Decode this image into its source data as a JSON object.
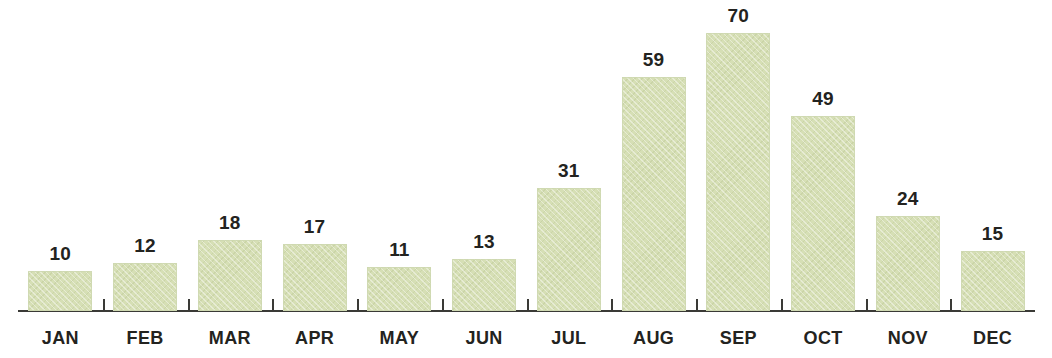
{
  "chart_data": {
    "type": "bar",
    "title": "",
    "subtitle": "",
    "xlabel": "",
    "ylabel": "",
    "categories": [
      "JAN",
      "FEB",
      "MAR",
      "APR",
      "MAY",
      "JUN",
      "JUL",
      "AUG",
      "SEP",
      "OCT",
      "NOV",
      "DEC"
    ],
    "values": [
      10,
      12,
      18,
      17,
      11,
      13,
      31,
      59,
      70,
      49,
      24,
      15
    ],
    "data_labels": [
      "10",
      "12",
      "18",
      "17",
      "11",
      "13",
      "31",
      "59",
      "70",
      "49",
      "24",
      "15"
    ],
    "series": [
      {
        "name": "",
        "values": [
          10,
          12,
          18,
          17,
          11,
          13,
          31,
          59,
          70,
          49,
          24,
          15
        ]
      }
    ],
    "ylim": [
      0,
      70
    ],
    "grid": false,
    "legend": "none",
    "axis": {
      "x_axis_visible": true,
      "y_axis_visible": false,
      "tick_marks": "between-categories",
      "tick_direction": "up"
    },
    "colors": {
      "bar_fill": "#d6dfb5",
      "bar_edge": "#ced8b0",
      "axis": "#3a3a36",
      "text": "#232320",
      "background": "#ffffff"
    }
  }
}
